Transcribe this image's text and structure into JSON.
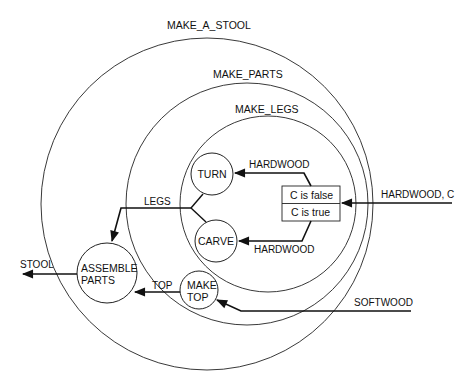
{
  "scopes": {
    "outer": "MAKE_A_STOOL",
    "middle": "MAKE_PARTS",
    "inner": "MAKE_LEGS"
  },
  "nodes": {
    "turn": "TURN",
    "carve": "CARVE",
    "assemble_line1": "ASSEMBLE",
    "assemble_line2": "PARTS",
    "make_top_line1": "MAKE",
    "make_top_line2": "TOP"
  },
  "decision": {
    "row1": "C is false",
    "row2": "C is true"
  },
  "flows": {
    "hardwood_c": "HARDWOOD, C",
    "hardwood_top": "HARDWOOD",
    "hardwood_bottom": "HARDWOOD",
    "legs": "LEGS",
    "top": "TOP",
    "softwood": "SOFTWOOD",
    "stool": "STOOL"
  },
  "colors": {
    "line": "#111111",
    "background": "#ffffff"
  }
}
